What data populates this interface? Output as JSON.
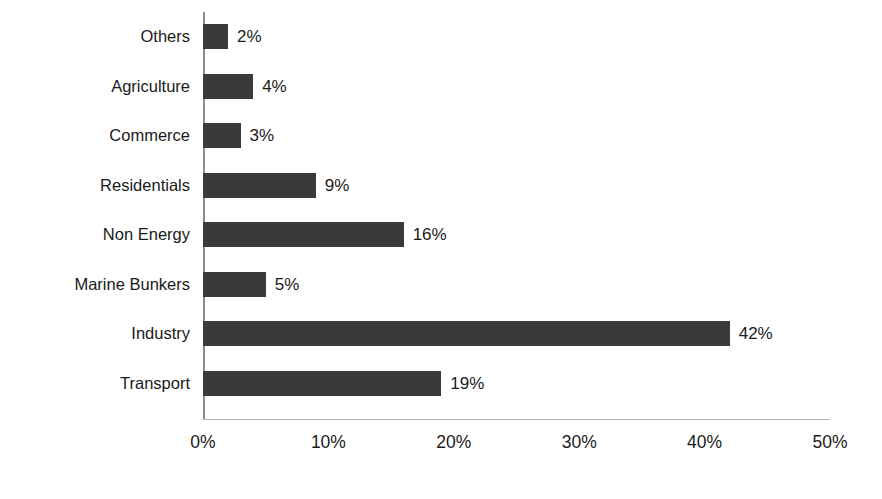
{
  "chart_data": {
    "type": "bar",
    "orientation": "horizontal",
    "title": "",
    "subtitle": "",
    "xlabel": "",
    "ylabel": "",
    "xlim": [
      0,
      50
    ],
    "grid": false,
    "legend": null,
    "value_suffix": "%",
    "categories": [
      "Others",
      "Agriculture",
      "Commerce",
      "Residentials",
      "Non Energy",
      "Marine Bunkers",
      "Industry",
      "Transport"
    ],
    "values": [
      2,
      4,
      3,
      9,
      16,
      5,
      42,
      19
    ],
    "data_labels": [
      "2%",
      "4%",
      "3%",
      "9%",
      "16%",
      "5%",
      "42%",
      "19%"
    ],
    "xticks": [
      0,
      10,
      20,
      30,
      40,
      50
    ],
    "xtick_labels": [
      "0%",
      "10%",
      "20%",
      "30%",
      "40%",
      "50%"
    ],
    "colors": {
      "bar": "#3a3a3a",
      "background": "#ffffff",
      "axis_line": "#8c8c8c",
      "baseline": "#b5b5b5",
      "text": "#1a1a1a"
    }
  }
}
